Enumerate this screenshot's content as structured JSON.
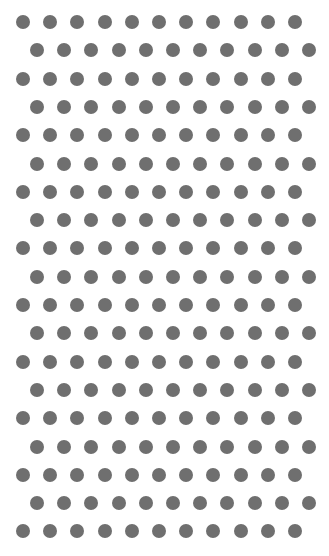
{
  "pattern": {
    "type": "staggered-dot-grid",
    "rows": 19,
    "dots_per_row": 11,
    "dot_diameter": 14,
    "dot_color": "#6f6f6f",
    "background": "#ffffff",
    "first_row_start_x": 23,
    "offset_row_start_x": 37,
    "first_row_y": 22,
    "col_spacing": 27.2,
    "row_spacing": 28.3
  }
}
